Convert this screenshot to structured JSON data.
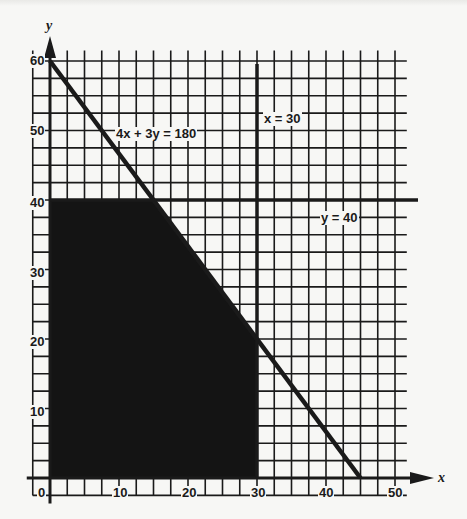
{
  "chart_data": {
    "type": "line",
    "title": "",
    "xlabel": "x",
    "ylabel": "y",
    "xlim": [
      0,
      52
    ],
    "ylim": [
      0,
      62
    ],
    "grid": true,
    "grid_step": 2.5,
    "x_ticks": [
      0,
      10,
      20,
      30,
      40,
      50
    ],
    "y_ticks": [
      10,
      20,
      30,
      40,
      50,
      60
    ],
    "series": [
      {
        "name": "4x + 3y = 180",
        "x": [
          0,
          45
        ],
        "y": [
          60,
          0
        ],
        "style": "thick-line"
      },
      {
        "name": "x = 30",
        "x": [
          30,
          30
        ],
        "y": [
          0,
          62
        ],
        "style": "thick-line"
      },
      {
        "name": "y = 40",
        "x": [
          0,
          52
        ],
        "y": [
          40,
          40
        ],
        "style": "thick-line"
      }
    ],
    "feasible_region": {
      "fill": "#141414",
      "vertices": [
        [
          0,
          0
        ],
        [
          0,
          40
        ],
        [
          15,
          40
        ],
        [
          30,
          20
        ],
        [
          30,
          0
        ]
      ]
    },
    "annotations": [
      {
        "text": "4x + 3y = 180",
        "x": 9,
        "y": 50
      },
      {
        "text": "x = 30",
        "x": 31,
        "y": 52.5
      },
      {
        "text": "y = 40",
        "x": 39,
        "y": 37.5
      }
    ],
    "legend": "none"
  },
  "labels": {
    "line1": "4x + 3y = 180",
    "line2": "x = 30",
    "line3": "y = 40",
    "x_axis": "x",
    "y_axis": "y",
    "x_ticks": [
      "0",
      "10",
      "20",
      "30",
      "40",
      "50"
    ],
    "y_ticks": [
      "10",
      "20",
      "30",
      "40",
      "50",
      "60"
    ]
  },
  "colors": {
    "background": "#f7f7f5",
    "ink": "#1a1a1a",
    "region": "#141414"
  }
}
